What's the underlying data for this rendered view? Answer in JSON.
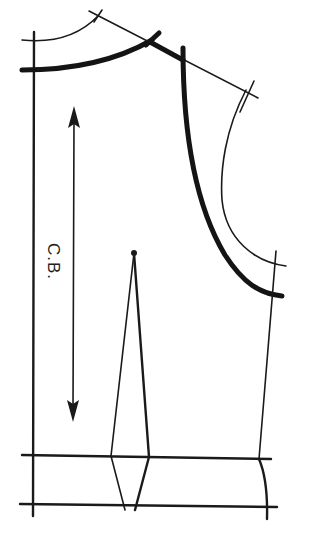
{
  "diagram": {
    "type": "sewing-pattern",
    "labels": {
      "center_back": "C.B."
    },
    "elements": [
      "center-back-line",
      "back-neckline-original",
      "back-neckline-adjusted",
      "shoulder-line",
      "armhole-original",
      "armhole-adjusted",
      "side-seam",
      "waist-line",
      "hip-line",
      "waist-dart",
      "grainline-arrow"
    ],
    "colors": {
      "line": "#1a1a1a",
      "background": "#ffffff"
    }
  }
}
